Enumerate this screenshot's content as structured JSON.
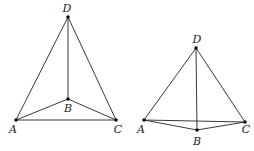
{
  "figures": [
    {
      "name": "left-tetrahedron",
      "points": {
        "D": {
          "label": "D",
          "x": 68,
          "y": 17,
          "lx": 67,
          "ly": 12
        },
        "B": {
          "label": "B",
          "x": 68,
          "y": 99,
          "lx": 68,
          "ly": 112
        },
        "A": {
          "label": "A",
          "x": 16,
          "y": 120,
          "lx": 13,
          "ly": 133
        },
        "C": {
          "label": "C",
          "x": 116,
          "y": 120,
          "lx": 118,
          "ly": 133
        }
      },
      "edges": [
        [
          "A",
          "D"
        ],
        [
          "D",
          "C"
        ],
        [
          "D",
          "B"
        ],
        [
          "A",
          "B"
        ],
        [
          "B",
          "C"
        ],
        [
          "A",
          "C"
        ]
      ]
    },
    {
      "name": "right-tetrahedron",
      "points": {
        "D": {
          "label": "D",
          "x": 196,
          "y": 48,
          "lx": 197,
          "ly": 43
        },
        "A": {
          "label": "A",
          "x": 144,
          "y": 120,
          "lx": 141,
          "ly": 133
        },
        "C": {
          "label": "C",
          "x": 245,
          "y": 122,
          "lx": 246,
          "ly": 133
        },
        "B": {
          "label": "B",
          "x": 197,
          "y": 130,
          "lx": 197,
          "ly": 145
        }
      },
      "edges": [
        [
          "A",
          "D"
        ],
        [
          "D",
          "C"
        ],
        [
          "D",
          "B"
        ],
        [
          "A",
          "B"
        ],
        [
          "B",
          "C"
        ],
        [
          "A",
          "C"
        ]
      ]
    }
  ],
  "colors": {
    "line": "#222222",
    "point": "#111111",
    "background": "#ffffff"
  }
}
